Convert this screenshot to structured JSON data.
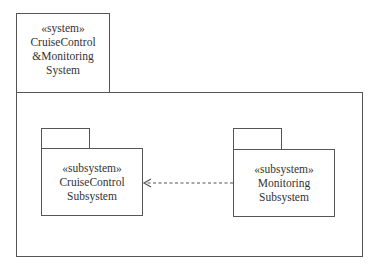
{
  "diagram": {
    "type": "UML package diagram",
    "system": {
      "stereotype": "«system»",
      "name_line1": "CruiseControl",
      "name_line2": "&Monitoring",
      "name_line3": "System"
    },
    "packages": [
      {
        "id": "cruise-control",
        "stereotype": "«subsystem»",
        "name_line1": "CruiseControl",
        "name_line2": "Subsystem"
      },
      {
        "id": "monitoring",
        "stereotype": "«subsystem»",
        "name_line1": "Monitoring",
        "name_line2": "Subsystem"
      }
    ],
    "dependencies": [
      {
        "from": "monitoring",
        "to": "cruise-control",
        "style": "dashed",
        "arrowhead": "open"
      }
    ],
    "colors": {
      "line": "#555555",
      "text": "#333333",
      "background": "#ffffff"
    }
  }
}
